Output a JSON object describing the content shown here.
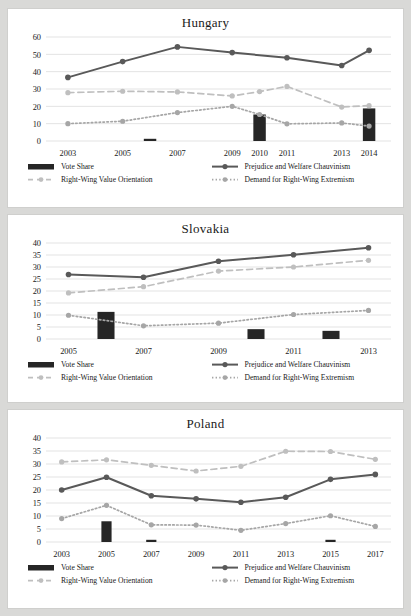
{
  "page": {
    "background_color": "#d9d9d7",
    "panel_color": "#ffffff"
  },
  "colors": {
    "bar": "#262626",
    "prejudice_line": "#595959",
    "value_orientation_line": "#bfbfbf",
    "extremism_line": "#a6a6a6",
    "gridline": "#e3e3e3",
    "text": "#1a1a1a"
  },
  "legend": {
    "vote_share": "Vote Share",
    "prejudice": "Prejudice and Welfare Chauvinism",
    "value_orientation": "Right-Wing Value Orientation",
    "extremism": "Demand for Right-Wing Extremism"
  },
  "chart_data": [
    {
      "type": "line",
      "title": "Hungary",
      "xlabel": "",
      "ylabel": "",
      "ylim": [
        0,
        60
      ],
      "yticks": [
        0,
        10,
        20,
        30,
        40,
        50,
        60
      ],
      "grid": true,
      "legend_position": "bottom",
      "categories": [
        "2003",
        "2005",
        "2007",
        "2009",
        "2010",
        "2011",
        "2013",
        "2014"
      ],
      "x_positions": [
        2003,
        2005,
        2007,
        2009,
        2010,
        2011,
        2013,
        2014
      ],
      "xlim": [
        2002.2,
        2014.8
      ],
      "series": [
        {
          "name": "Prejudice and Welfare Chauvinism",
          "style": "solid",
          "x": [
            2003,
            2005,
            2007,
            2009,
            2011,
            2013,
            2014
          ],
          "values": [
            36.7,
            45.8,
            54.3,
            51.0,
            48.0,
            43.6,
            52.3
          ]
        },
        {
          "name": "Right-Wing Value Orientation",
          "style": "dashed",
          "x": [
            2003,
            2005,
            2007,
            2009,
            2010,
            2011,
            2013,
            2014
          ],
          "values": [
            27.9,
            28.7,
            28.3,
            26.0,
            28.5,
            31.5,
            19.6,
            20.4
          ]
        },
        {
          "name": "Demand for Right-Wing Extremism",
          "style": "dotted",
          "x": [
            2003,
            2005,
            2007,
            2009,
            2010,
            2011,
            2013,
            2014
          ],
          "values": [
            10.0,
            11.4,
            16.4,
            20.0,
            15.3,
            9.9,
            10.4,
            8.6
          ]
        },
        {
          "name": "Vote Share",
          "style": "bar",
          "x": [
            2006,
            2010,
            2014
          ],
          "values": [
            1.1,
            15.3,
            18.8
          ]
        }
      ]
    },
    {
      "type": "line",
      "title": "Slovakia",
      "xlabel": "",
      "ylabel": "",
      "ylim": [
        0,
        40
      ],
      "yticks": [
        0,
        5,
        10,
        15,
        20,
        25,
        30,
        35,
        40
      ],
      "grid": true,
      "legend_position": "bottom",
      "categories": [
        "2005",
        "2007",
        "2009",
        "2011",
        "2013"
      ],
      "x_positions": [
        2005,
        2007,
        2009,
        2011,
        2013
      ],
      "xlim": [
        2004.4,
        2013.6
      ],
      "series": [
        {
          "name": "Prejudice and Welfare Chauvinism",
          "style": "solid",
          "x": [
            2005,
            2007,
            2009,
            2011,
            2013
          ],
          "values": [
            26.9,
            25.7,
            32.4,
            35.1,
            38.0
          ]
        },
        {
          "name": "Right-Wing Value Orientation",
          "style": "dashed",
          "x": [
            2005,
            2007,
            2009,
            2011,
            2013
          ],
          "values": [
            19.2,
            21.8,
            28.3,
            30.0,
            32.8
          ]
        },
        {
          "name": "Demand for Right-Wing Extremism",
          "style": "dotted",
          "x": [
            2005,
            2007,
            2009,
            2011,
            2013
          ],
          "values": [
            9.9,
            5.5,
            6.6,
            10.2,
            11.9
          ]
        },
        {
          "name": "Vote Share",
          "style": "bar",
          "x": [
            2006,
            2010,
            2012
          ],
          "values": [
            11.3,
            4.1,
            3.4
          ]
        }
      ]
    },
    {
      "type": "line",
      "title": "Poland",
      "xlabel": "",
      "ylabel": "",
      "ylim": [
        0,
        40
      ],
      "yticks": [
        0,
        5,
        10,
        15,
        20,
        25,
        30,
        35,
        40
      ],
      "grid": true,
      "legend_position": "bottom",
      "categories": [
        "2003",
        "2005",
        "2007",
        "2009",
        "2011",
        "2013",
        "2015",
        "2017"
      ],
      "x_positions": [
        2003,
        2005,
        2007,
        2009,
        2011,
        2013,
        2015,
        2017
      ],
      "xlim": [
        2002.3,
        2017.7
      ],
      "series": [
        {
          "name": "Prejudice and Welfare Chauvinism",
          "style": "solid",
          "x": [
            2003,
            2005,
            2007,
            2009,
            2011,
            2013,
            2015,
            2017
          ],
          "values": [
            20.0,
            24.9,
            17.8,
            16.6,
            15.3,
            17.2,
            24.1,
            26.0
          ]
        },
        {
          "name": "Right-Wing Value Orientation",
          "style": "dashed",
          "x": [
            2003,
            2005,
            2007,
            2009,
            2011,
            2013,
            2015,
            2017
          ],
          "values": [
            30.8,
            31.6,
            29.5,
            27.3,
            29.1,
            34.9,
            34.8,
            31.8
          ]
        },
        {
          "name": "Demand for Right-Wing Extremism",
          "style": "dotted",
          "x": [
            2003,
            2005,
            2007,
            2009,
            2011,
            2013,
            2015,
            2017
          ],
          "values": [
            9.0,
            14.1,
            6.6,
            6.5,
            4.5,
            7.1,
            10.1,
            6.0
          ]
        },
        {
          "name": "Vote Share",
          "style": "bar",
          "x": [
            2005,
            2007,
            2015
          ],
          "values": [
            7.97,
            0.8,
            0.7
          ]
        }
      ]
    }
  ]
}
